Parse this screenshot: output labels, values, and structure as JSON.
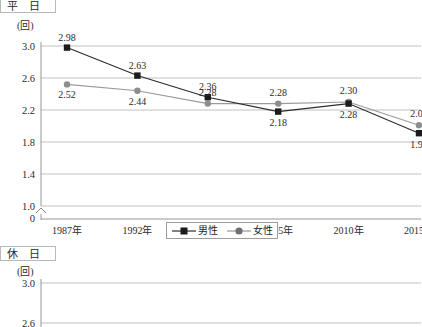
{
  "figure": {
    "sections": [
      {
        "id": "weekday",
        "title": "平　日",
        "unit": "(回)"
      },
      {
        "id": "holiday",
        "title": "休　日",
        "unit": "(回)"
      }
    ],
    "legend": {
      "items": [
        {
          "label": "男性",
          "marker": "square-marker-icon",
          "color": "#1b1b1b"
        },
        {
          "label": "女性",
          "marker": "circle-marker-icon",
          "color": "#8d8d8d"
        }
      ]
    }
  },
  "chart_data": [
    {
      "type": "line",
      "title": "平　日",
      "xlabel": "",
      "ylabel": "(回)",
      "categories": [
        "1987年",
        "1992年",
        "1999年",
        "2005年",
        "2010年",
        "2015年"
      ],
      "yticks": [
        "3.0",
        "2.6",
        "2.2",
        "1.8",
        "1.4",
        "1.0",
        "0"
      ],
      "ylim": [
        1.0,
        3.1
      ],
      "axis_break": true,
      "grid": true,
      "legend_position": "bottom-center",
      "series": [
        {
          "name": "男性",
          "color": "#1b1b1b",
          "marker": "square",
          "values": [
            2.98,
            2.63,
            2.36,
            2.18,
            2.28,
            1.91
          ],
          "labels": [
            "2.98",
            "2.63",
            "2.36",
            "2.18",
            "2.28",
            "1.91"
          ]
        },
        {
          "name": "女性",
          "color": "#8d8d8d",
          "marker": "circle",
          "values": [
            2.52,
            2.44,
            2.28,
            2.28,
            2.3,
            2.01
          ],
          "labels": [
            "2.52",
            "2.44",
            "2.28",
            "2.28",
            "2.30",
            "2.01"
          ]
        }
      ]
    },
    {
      "type": "line",
      "title": "休　日",
      "xlabel": "",
      "ylabel": "(回)",
      "categories": [],
      "yticks": [
        "3.0",
        "2.6"
      ],
      "ylim": [
        2.4,
        3.1
      ],
      "grid": true,
      "truncated": true,
      "series": []
    }
  ]
}
